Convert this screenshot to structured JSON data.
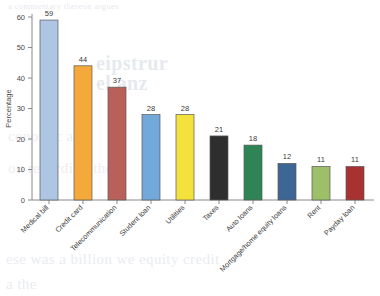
{
  "chart_data": {
    "type": "bar",
    "title": "",
    "subtitle": "",
    "xlabel": "",
    "ylabel": "Percentage",
    "ylim": [
      0,
      60
    ],
    "yticks": [
      0,
      10,
      20,
      30,
      40,
      50,
      60
    ],
    "grid": false,
    "legend": "none",
    "value_labels": true,
    "categories": [
      "Medical bill",
      "Credit card",
      "Telecommunication",
      "Student loan",
      "Utilities",
      "Taxes",
      "Auto loans",
      "Mortgage/home equity loans",
      "Rent",
      "Payday loan"
    ],
    "values": [
      59,
      44,
      37,
      28,
      28,
      21,
      18,
      12,
      11,
      11
    ],
    "bar_colors": [
      "#aec6e3",
      "#f4a93a",
      "#b9605a",
      "#72a8da",
      "#f4e23c",
      "#2e2e2e",
      "#2f8456",
      "#3e6694",
      "#9cbf68",
      "#a83232"
    ],
    "bar_edge_color": "#5a5a5a",
    "axis_color": "#8a8a8a"
  },
  "bleed_through": {
    "line1": "a commentary thereon argues",
    "line2": "eipstrur",
    "line3": "el anz",
    "line4": "conomic and",
    "line5": "ou regarding the",
    "line6": "ese was a billion we equity credit",
    "line7": "a the"
  }
}
